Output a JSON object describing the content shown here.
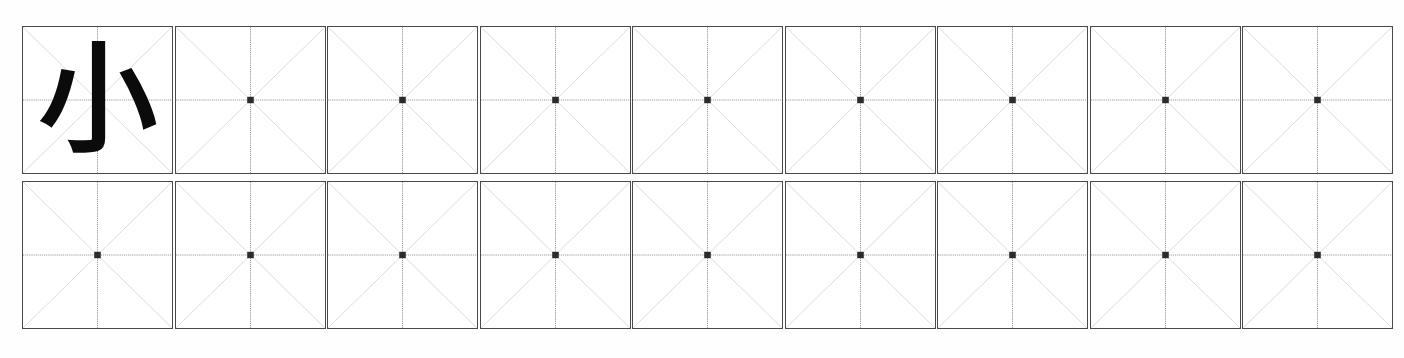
{
  "worksheet": {
    "type": "chinese-character-practice-grid",
    "grid_style": "mizige",
    "rows": 2,
    "columns": 9,
    "cell_size_px": 151,
    "background_color": "#fefefe",
    "border_color": "#4a4a4a",
    "center_line_color": "#8f8f8f",
    "diagonal_line_color": "#c9c9c9",
    "center_dot_color": "#2b2b2b",
    "ink_color": "#0b0b0b"
  },
  "character": {
    "glyph": "小",
    "pinyin": "xiǎo",
    "meaning": "small",
    "stroke_count": 3
  },
  "cells": [
    [
      {
        "id": "r1c1",
        "char": "小",
        "filled": true
      },
      {
        "id": "r1c2",
        "char": "",
        "filled": false
      },
      {
        "id": "r1c3",
        "char": "",
        "filled": false
      },
      {
        "id": "r1c4",
        "char": "",
        "filled": false
      },
      {
        "id": "r1c5",
        "char": "",
        "filled": false
      },
      {
        "id": "r1c6",
        "char": "",
        "filled": false
      },
      {
        "id": "r1c7",
        "char": "",
        "filled": false
      },
      {
        "id": "r1c8",
        "char": "",
        "filled": false
      },
      {
        "id": "r1c9",
        "char": "",
        "filled": false
      }
    ],
    [
      {
        "id": "r2c1",
        "char": "",
        "filled": false
      },
      {
        "id": "r2c2",
        "char": "",
        "filled": false
      },
      {
        "id": "r2c3",
        "char": "",
        "filled": false
      },
      {
        "id": "r2c4",
        "char": "",
        "filled": false
      },
      {
        "id": "r2c5",
        "char": "",
        "filled": false
      },
      {
        "id": "r2c6",
        "char": "",
        "filled": false
      },
      {
        "id": "r2c7",
        "char": "",
        "filled": false
      },
      {
        "id": "r2c8",
        "char": "",
        "filled": false
      },
      {
        "id": "r2c9",
        "char": "",
        "filled": false
      }
    ]
  ]
}
